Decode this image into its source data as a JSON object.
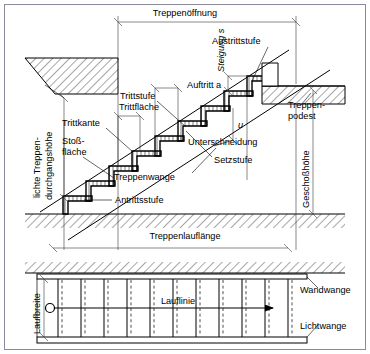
{
  "figure": {
    "language": "de"
  },
  "colors": {
    "line": "#000000",
    "dimension": "#3a3a3a",
    "frame": "#8a8a9a",
    "hatch": "#000000",
    "background": "#ffffff"
  },
  "section_view": {
    "dimensions": [
      {
        "id": "treppenoeffnung",
        "label": "Treppenöffnung",
        "orientation": "horizontal"
      },
      {
        "id": "lichte-treppendurchgangshoehe",
        "label_line1": "lichte Treppen-",
        "label_line2": "durchgangshöhe",
        "orientation": "vertical"
      },
      {
        "id": "geschosshoehe",
        "label": "Geschoßhöhe",
        "orientation": "vertical"
      },
      {
        "id": "treppenlauflaenge",
        "label": "Treppenlauflänge",
        "orientation": "horizontal"
      },
      {
        "id": "auftritt",
        "label": "Auftritt a",
        "symbol": "a",
        "orientation": "horizontal"
      },
      {
        "id": "steigung",
        "label": "Steigung s",
        "symbol": "s",
        "orientation": "vertical"
      },
      {
        "id": "trittflaeche",
        "label": "Trittfläche",
        "orientation": "horizontal"
      },
      {
        "id": "unterschneidung",
        "label": "Unterschneidung",
        "symbol": "u",
        "orientation": "horizontal"
      }
    ],
    "callouts": [
      {
        "id": "austrittstufe",
        "label": "Austrittstufe"
      },
      {
        "id": "trittstufe",
        "label": "Trittstufe"
      },
      {
        "id": "trittkante",
        "label": "Trittkante"
      },
      {
        "id": "stossflaeche",
        "label_line1": "Stoß-",
        "label_line2": "fläche"
      },
      {
        "id": "setzstufe",
        "label": "Setzstufe"
      },
      {
        "id": "treppenwange",
        "label": "Treppenwange"
      },
      {
        "id": "antrittsstufe",
        "label": "Antrittsstufe"
      },
      {
        "id": "treppenpodest",
        "label_line1": "Treppen-",
        "label_line2": "podest"
      }
    ],
    "symbols": {
      "u": "u",
      "a": "a",
      "s": "s"
    }
  },
  "plan_view": {
    "callouts": [
      {
        "id": "laufbreite",
        "label": "Laufbreite",
        "orientation": "vertical"
      },
      {
        "id": "lauflinie",
        "label": "Lauflinie",
        "orientation": "horizontal"
      },
      {
        "id": "wandwange",
        "label": "Wandwange"
      },
      {
        "id": "lichtwange",
        "label": "Lichtwange"
      }
    ],
    "step_count": 11,
    "direction_arrow": "right"
  }
}
